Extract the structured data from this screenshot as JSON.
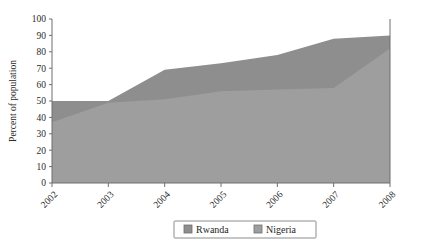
{
  "chart_data": {
    "type": "area",
    "stacked": false,
    "title": "",
    "subtitle": "",
    "xlabel": "",
    "ylabel": "Percent of population",
    "categories": [
      "2002",
      "2003",
      "2004",
      "2005",
      "2006",
      "2007",
      "2008"
    ],
    "x": [
      2002,
      2003,
      2004,
      2005,
      2006,
      2007,
      2008
    ],
    "xlim": [
      2002,
      2008
    ],
    "ylim": [
      0,
      100
    ],
    "yticks": [
      0,
      10,
      20,
      30,
      40,
      50,
      60,
      70,
      80,
      90,
      100
    ],
    "ytick_labels": [
      "0",
      "10",
      "20",
      "30",
      "40",
      "50",
      "60",
      "70",
      "80",
      "90",
      "100"
    ],
    "xtick_labels": [
      "2002",
      "2003",
      "2004",
      "2005",
      "2006",
      "2007",
      "2008"
    ],
    "xtick_rotation": 45,
    "grid": false,
    "legend_position": "bottom",
    "series": [
      {
        "name": "Rwanda",
        "color": "#8e8e8e",
        "values": [
          50,
          50,
          69,
          73,
          78,
          88,
          90
        ]
      },
      {
        "name": "Nigeria",
        "color": "#9e9e9e",
        "values": [
          37,
          49,
          51,
          56,
          57,
          58,
          82
        ]
      }
    ],
    "legend": [
      {
        "label": "Rwanda",
        "color": "#8e8e8e"
      },
      {
        "label": "Nigeria",
        "color": "#9e9e9e"
      }
    ]
  },
  "colors": {
    "rwanda": "#8e8e8e",
    "nigeria": "#9e9e9e",
    "axis": "#6e6e6e",
    "text": "#2b2b2b",
    "background": "#ffffff",
    "legend_border": "#8c8c8c"
  }
}
